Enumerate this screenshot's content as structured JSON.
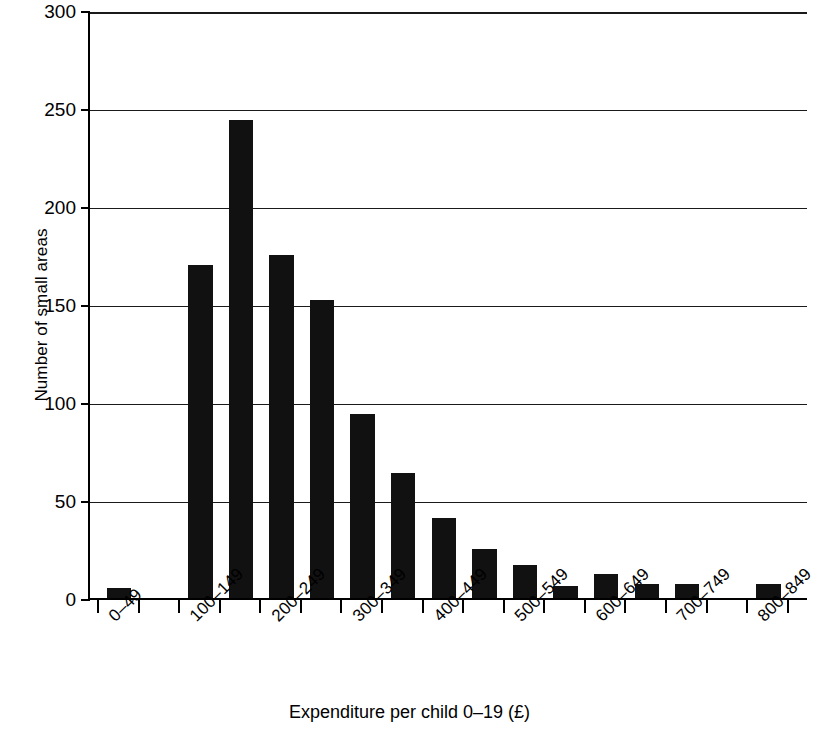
{
  "chart_data": {
    "type": "bar",
    "title": "",
    "xlabel": "Expenditure per child 0–19 (£)",
    "ylabel": "Number of small areas",
    "categories": [
      "0–49",
      "50–99",
      "100–149",
      "150–199",
      "200–249",
      "250–299",
      "300–349",
      "350–399",
      "400–449",
      "450–499",
      "500–549",
      "550–599",
      "600–649",
      "650–699",
      "700–749",
      "750–799",
      "800–849"
    ],
    "values": [
      5,
      0,
      170,
      244,
      175,
      152,
      94,
      64,
      41,
      25,
      17,
      6,
      12,
      7,
      7,
      0,
      7
    ],
    "ylim": [
      0,
      300
    ],
    "yticks": [
      0,
      50,
      100,
      150,
      200,
      250,
      300
    ],
    "ytick_labels": [
      "0",
      "50",
      "100",
      "150",
      "200",
      "250",
      "300"
    ],
    "xtick_labels_shown": [
      "0–49",
      "100–149",
      "200–249",
      "300–349",
      "400–449",
      "500–549",
      "600–649",
      "700–749",
      "800–849"
    ],
    "xtick_label_indices": [
      0,
      2,
      4,
      6,
      8,
      10,
      12,
      14,
      16
    ],
    "grid": true,
    "legend": null,
    "bar_color": "#111111",
    "background_color": "#ffffff",
    "axis_color": "#000000",
    "rotation_xticklabels": -45
  }
}
